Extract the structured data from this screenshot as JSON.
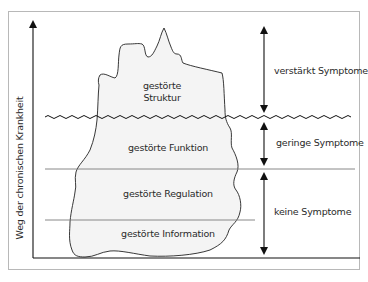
{
  "diagram": {
    "type": "iceberg-model",
    "y_axis_label": "Weg der chronischen Krankheit",
    "layers": [
      {
        "id": "struktur",
        "label_line1": "gestörte",
        "label_line2": "Struktur"
      },
      {
        "id": "funktion",
        "label": "gestörte Funktion"
      },
      {
        "id": "regulation",
        "label": "gestörte Regulation"
      },
      {
        "id": "information",
        "label": "gestörte Information"
      }
    ],
    "symptom_ranges": [
      {
        "id": "verstaerkt",
        "label": "verstärkt Symptome"
      },
      {
        "id": "gering",
        "label": "geringe Symptome"
      },
      {
        "id": "keine",
        "label": "keine Symptome"
      }
    ],
    "colors": {
      "frame": "#b8b8b8",
      "lines": "#111111",
      "divider": "#7a7a7a",
      "iceberg_fill": "#f4f4f4",
      "text": "#2a2a2a"
    }
  }
}
